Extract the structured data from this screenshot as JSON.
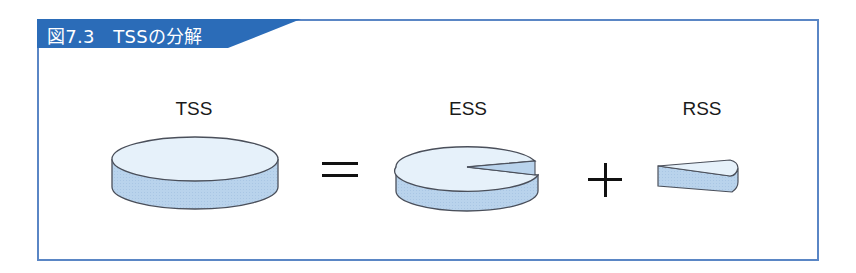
{
  "figure": {
    "title": "図7.3　TSSの分解",
    "accent_color": "#2b6cb8",
    "border_color": "#5a86c5"
  },
  "terms": [
    {
      "label": "TSS",
      "shape": "full-disc"
    },
    {
      "label": "ESS",
      "shape": "disc-with-wedge-removed"
    },
    {
      "label": "RSS",
      "shape": "wedge"
    }
  ],
  "operators": {
    "equals": "=",
    "plus": "+"
  },
  "colors": {
    "disc_top": "#e6f1fa",
    "disc_side": "#b9d3ec",
    "outline": "#4a4f5a"
  }
}
